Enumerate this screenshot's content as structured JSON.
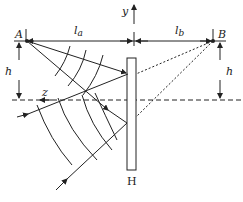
{
  "diagram": {
    "labels": {
      "point_a": "A",
      "point_b": "B",
      "distance_a": "l",
      "distance_a_sub": "a",
      "distance_b": "l",
      "distance_b_sub": "b",
      "height_left": "h",
      "height_right": "h",
      "axis_y": "y",
      "axis_z": "z",
      "hologram": "H"
    },
    "colors": {
      "line": "#222222",
      "background": "#ffffff"
    }
  }
}
